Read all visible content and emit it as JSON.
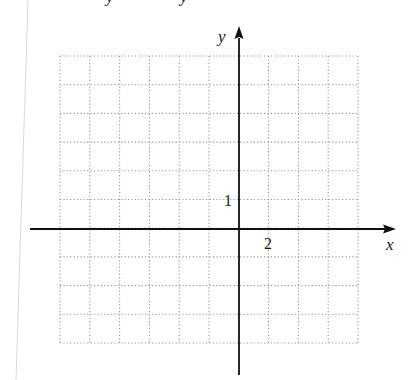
{
  "figure": {
    "type": "coordinate-grid",
    "axes": {
      "x_label": "x",
      "y_label": "y",
      "x_tick_label": "2",
      "y_tick_label": "1",
      "x_tick_value": 2,
      "y_tick_value": 1
    },
    "grid": {
      "columns": 10,
      "rows": 10,
      "cells_left_of_y_axis": 6,
      "cells_right_of_y_axis": 4,
      "cells_above_x_axis": 6,
      "cells_below_x_axis": 4,
      "x_units_per_cell": 1,
      "y_units_per_cell": 1,
      "x_range": [
        -6,
        4
      ],
      "y_range": [
        -4,
        6
      ],
      "line_style": "dotted"
    },
    "top_text_fragment": "y   y",
    "colors": {
      "axis": "#111111",
      "grid": "#9a9a9a",
      "page_edge": "#d8d8d8",
      "background": "#ffffff"
    }
  }
}
